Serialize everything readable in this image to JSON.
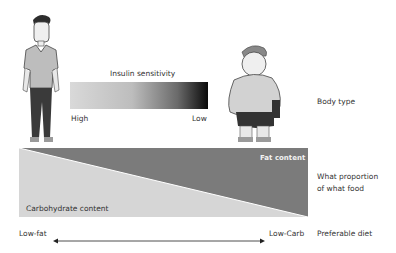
{
  "diagram": {
    "insulin_sensitivity": {
      "title": "Insulin sensitivity",
      "low_end_label": "High",
      "high_end_label": "Low",
      "gradient_colors": [
        "#d9d9d9",
        "#0a0a0a"
      ]
    },
    "figures": [
      {
        "name": "thin-person",
        "description": "slim man standing"
      },
      {
        "name": "obese-person",
        "description": "overweight man standing"
      }
    ],
    "food_proportion": {
      "upper_region_label": "Fat content",
      "lower_region_label": "Carbohydrate content",
      "fat_color": "#7b7b7b",
      "carb_color": "#d6d6d6"
    },
    "diet_axis": {
      "left_label": "Low-fat",
      "right_label": "Low-Carb"
    },
    "row_labels": {
      "body_type": "Body type",
      "proportion_line1": "What proportion",
      "proportion_line2": "of what food",
      "preferable_diet": "Preferable diet"
    }
  }
}
